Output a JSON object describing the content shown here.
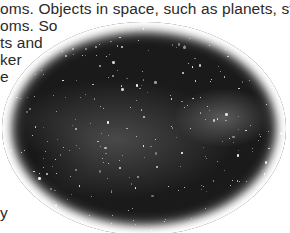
{
  "text": {
    "lines": [
      "oms. Objects in space, such as planets, stars",
      "oms. So",
      "ts and",
      "ker",
      "e",
      "y",
      "."
    ]
  },
  "figure": {
    "shape": "oval vignette",
    "colors": {
      "sky": "#1a1a1a",
      "stars": "#ffffff",
      "page": "#ffffff",
      "text": "#2a2a2a"
    }
  }
}
